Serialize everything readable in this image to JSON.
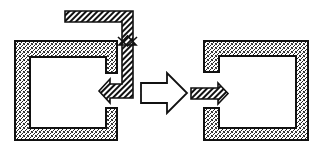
{
  "diagram": {
    "title": "",
    "colors": {
      "background": "#ffffff",
      "stroke": "#111111",
      "stipple_fill": "#9a9a9a",
      "interior": "#ffffff"
    },
    "nodes": [
      {
        "id": "left-enclosure",
        "shape": "c-shaped-wall",
        "fill": "stippled",
        "opening_side": "right",
        "outer": [
          15,
          41,
          117,
          140
        ],
        "inner": [
          30,
          57,
          106,
          128
        ],
        "opening": [
          73,
          108
        ]
      },
      {
        "id": "right-enclosure",
        "shape": "c-shaped-wall",
        "fill": "stippled",
        "opening_side": "left",
        "outer": [
          204,
          41,
          308,
          140
        ],
        "inner": [
          219,
          56,
          296,
          128
        ],
        "opening": [
          72,
          108
        ]
      }
    ],
    "arrows": [
      {
        "id": "bent-hatched-arrow",
        "fill": "hatched",
        "path": "enters top, runs right, turns down, turns left into left enclosure opening"
      },
      {
        "id": "transition-arrow",
        "fill": "white",
        "direction": "right"
      },
      {
        "id": "straight-hatched-arrow",
        "fill": "hatched",
        "direction": "right"
      }
    ],
    "labels": []
  }
}
